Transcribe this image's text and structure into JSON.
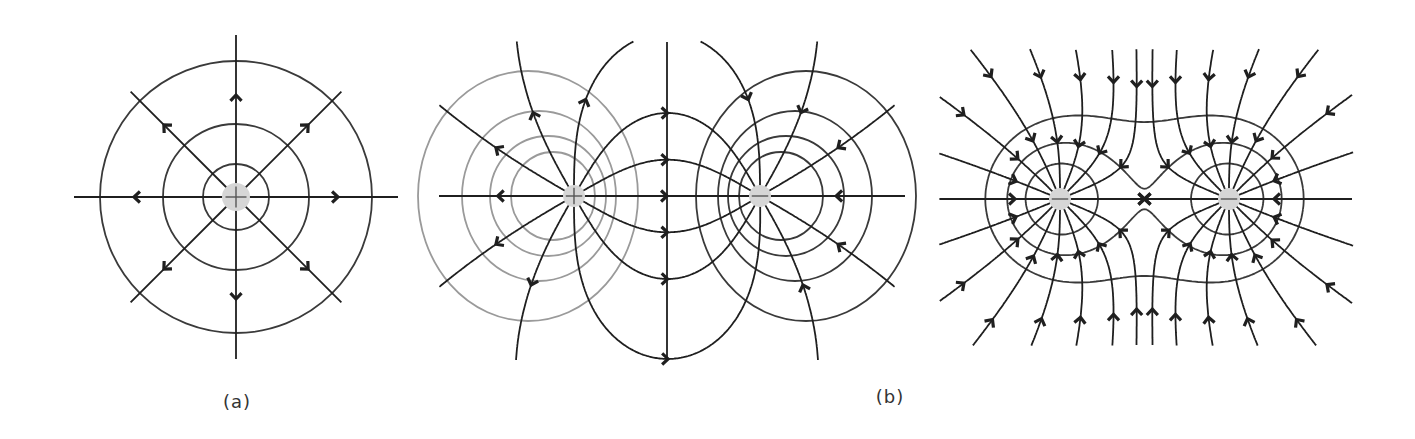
{
  "figure": {
    "colors": {
      "field_line": "#1f1f1f",
      "equipotential_dark": "#3a3a3a",
      "equipotential_light": "#9a9a9a",
      "charge_fill": "#d6d6d6",
      "charge_sign": "#555555",
      "label": "#333333"
    }
  },
  "panels": [
    {
      "id": "a",
      "label": "(a)",
      "label_pos": [
        237,
        403
      ],
      "title": "Single point charge",
      "charges": [
        {
          "x": 236,
          "y": 197,
          "q": 1,
          "sign": "+",
          "r": 14
        }
      ],
      "equipotential_radii": [
        33,
        73,
        136
      ],
      "field_line_angles_deg": [
        0,
        45,
        90,
        135,
        180,
        225,
        270,
        315
      ],
      "field_line_length": 162,
      "arrow_distance": 102
    },
    {
      "id": "b",
      "label": "(b)",
      "label_pos": [
        890,
        398
      ],
      "title": "Electric dipole (+ and − charges)",
      "charges": [
        {
          "x": 574,
          "y": 196,
          "q": 1,
          "sign": "+",
          "r": 11
        },
        {
          "x": 760,
          "y": 196,
          "q": -1,
          "sign": "−",
          "r": 11
        }
      ],
      "field_lines_per_charge": 12,
      "bounds": [
        440,
        42,
        905,
        360
      ],
      "equipotentials_left": [
        {
          "cx": 553,
          "cy": 196,
          "rx": 42,
          "ry": 44
        },
        {
          "cx": 548,
          "cy": 196,
          "rx": 58,
          "ry": 60
        },
        {
          "cx": 539,
          "cy": 196,
          "rx": 77,
          "ry": 85
        },
        {
          "cx": 528,
          "cy": 196,
          "rx": 110,
          "ry": 125
        }
      ],
      "equipotentials_right": [
        {
          "cx": 781,
          "cy": 196,
          "rx": 42,
          "ry": 44
        },
        {
          "cx": 786,
          "cy": 196,
          "rx": 58,
          "ry": 60
        },
        {
          "cx": 795,
          "cy": 196,
          "rx": 77,
          "ry": 85
        },
        {
          "cx": 806,
          "cy": 196,
          "rx": 110,
          "ry": 125
        }
      ]
    },
    {
      "id": "c",
      "label": "",
      "title": "Two negative charges",
      "charges": [
        {
          "x": 1060,
          "y": 199,
          "q": -1,
          "sign": "−",
          "r": 11
        },
        {
          "x": 1229,
          "y": 199,
          "q": -1,
          "sign": "−",
          "r": 11
        }
      ],
      "field_lines_per_charge": 16,
      "bounds": [
        940,
        50,
        1352,
        345
      ],
      "equipotential_levels": [
        3.4,
        2.35,
        1.75
      ]
    }
  ]
}
